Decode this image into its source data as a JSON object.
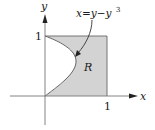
{
  "diagram": {
    "title": "",
    "axes": {
      "x_label": "x",
      "y_label": "y"
    },
    "ticks": {
      "x_one": "1",
      "y_one": "1"
    },
    "curve": {
      "equation_label": "x=y−y",
      "exponent": "3",
      "equation": "x = y - y^3"
    },
    "region": {
      "label": "R"
    },
    "colors": {
      "region_fill": "#d3d3d3",
      "stroke": "#555555",
      "axis": "#777777"
    }
  }
}
